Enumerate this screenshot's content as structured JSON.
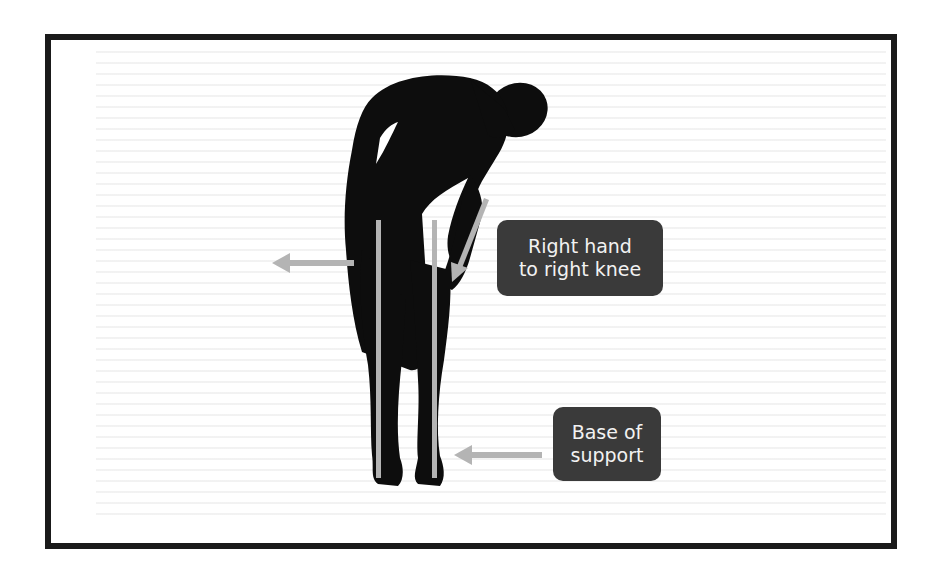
{
  "figure": {
    "frame_color": "#1a1a1a",
    "silhouette_color": "#0d0d0d",
    "arrow_color": "#b4b4b4",
    "label_bg": "#3a3a3a",
    "label_text_color": "#f2f2f2"
  },
  "labels": {
    "hand": {
      "line1": "Right hand",
      "line2": "to right knee"
    },
    "base": {
      "line1": "Base of",
      "line2": "support"
    }
  }
}
